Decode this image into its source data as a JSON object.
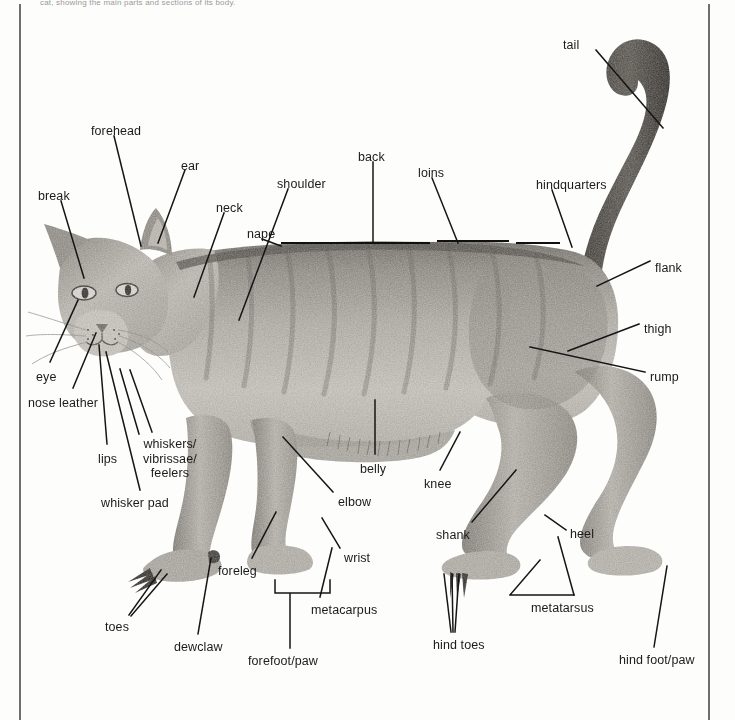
{
  "document": {
    "caption_fragment": "cat, showing the main parts and sections of its body.",
    "figure_title": "Anatomy of the cat — external parts",
    "subject": "cat",
    "illustration_style": "pencil drawing"
  },
  "colors": {
    "ink": "#151515",
    "page": "#fdfdfc",
    "rule": "#6e6e6e",
    "fur_light": "#c9c6c0",
    "fur_mid": "#9b978f",
    "fur_dark": "#6a665f",
    "fur_darkest": "#3d3a35"
  },
  "labels": [
    {
      "id": "tail",
      "text": "tail",
      "x": 563,
      "y": 38,
      "align": "left"
    },
    {
      "id": "forehead",
      "text": "forehead",
      "x": 91,
      "y": 124,
      "align": "left"
    },
    {
      "id": "ear",
      "text": "ear",
      "x": 181,
      "y": 159,
      "align": "left"
    },
    {
      "id": "back",
      "text": "back",
      "x": 358,
      "y": 150,
      "align": "left"
    },
    {
      "id": "loins",
      "text": "loins",
      "x": 418,
      "y": 166,
      "align": "left"
    },
    {
      "id": "hindquarters",
      "text": "hindquarters",
      "x": 536,
      "y": 178,
      "align": "left"
    },
    {
      "id": "shoulder",
      "text": "shoulder",
      "x": 277,
      "y": 177,
      "align": "left"
    },
    {
      "id": "break",
      "text": "break",
      "x": 38,
      "y": 189,
      "align": "left"
    },
    {
      "id": "neck",
      "text": "neck",
      "x": 216,
      "y": 201,
      "align": "left"
    },
    {
      "id": "nape",
      "text": "nape",
      "x": 247,
      "y": 227,
      "align": "left"
    },
    {
      "id": "flank",
      "text": "flank",
      "x": 655,
      "y": 261,
      "align": "left"
    },
    {
      "id": "thigh",
      "text": "thigh",
      "x": 644,
      "y": 322,
      "align": "left"
    },
    {
      "id": "rump",
      "text": "rump",
      "x": 650,
      "y": 370,
      "align": "left"
    },
    {
      "id": "eye",
      "text": "eye",
      "x": 36,
      "y": 370,
      "align": "left"
    },
    {
      "id": "nose-leather",
      "text": "nose leather",
      "x": 28,
      "y": 396,
      "align": "left"
    },
    {
      "id": "whiskers",
      "text": "whiskers/\nvibrissae/\nfeelers",
      "x": 143,
      "y": 437,
      "align": "left"
    },
    {
      "id": "lips",
      "text": "lips",
      "x": 98,
      "y": 452,
      "align": "left"
    },
    {
      "id": "belly",
      "text": "belly",
      "x": 360,
      "y": 462,
      "align": "left"
    },
    {
      "id": "knee",
      "text": "knee",
      "x": 424,
      "y": 477,
      "align": "left"
    },
    {
      "id": "whisker-pad",
      "text": "whisker pad",
      "x": 101,
      "y": 496,
      "align": "left"
    },
    {
      "id": "elbow",
      "text": "elbow",
      "x": 338,
      "y": 495,
      "align": "left"
    },
    {
      "id": "shank",
      "text": "shank",
      "x": 436,
      "y": 528,
      "align": "left"
    },
    {
      "id": "heel",
      "text": "heel",
      "x": 570,
      "y": 527,
      "align": "left"
    },
    {
      "id": "wrist",
      "text": "wrist",
      "x": 344,
      "y": 551,
      "align": "left"
    },
    {
      "id": "foreleg",
      "text": "foreleg",
      "x": 218,
      "y": 564,
      "align": "left"
    },
    {
      "id": "metatarsus",
      "text": "metatarsus",
      "x": 531,
      "y": 601,
      "align": "left"
    },
    {
      "id": "metacarpus",
      "text": "metacarpus",
      "x": 311,
      "y": 603,
      "align": "left"
    },
    {
      "id": "toes",
      "text": "toes",
      "x": 105,
      "y": 620,
      "align": "left"
    },
    {
      "id": "hind-toes",
      "text": "hind toes",
      "x": 433,
      "y": 638,
      "align": "left"
    },
    {
      "id": "dewclaw",
      "text": "dewclaw",
      "x": 174,
      "y": 640,
      "align": "left"
    },
    {
      "id": "hind-foot-paw",
      "text": "hind foot/paw",
      "x": 619,
      "y": 653,
      "align": "left"
    },
    {
      "id": "forefoot-paw",
      "text": "forefoot/paw",
      "x": 248,
      "y": 654,
      "align": "left"
    }
  ],
  "leaders": [
    {
      "id": "tail",
      "d": "M 596 50 L 663 128"
    },
    {
      "id": "forehead",
      "d": "M 114 136 L 141 246"
    },
    {
      "id": "ear",
      "d": "M 185 170 L 158 243"
    },
    {
      "id": "back",
      "d": "M 373 162 L 373 243"
    },
    {
      "id": "loins",
      "d": "M 432 178 L 458 243"
    },
    {
      "id": "hindquarters",
      "d": "M 552 190 L 572 247"
    },
    {
      "id": "shoulder",
      "d": "M 288 189 L 239 320"
    },
    {
      "id": "break",
      "d": "M 61 201 L 84 278"
    },
    {
      "id": "neck",
      "d": "M 224 213 L 194 297"
    },
    {
      "id": "nape",
      "d": "M 262 239 L 281 246"
    },
    {
      "id": "flank",
      "d": "M 650 261 L 597 286"
    },
    {
      "id": "thigh",
      "d": "M 639 324 L 568 351"
    },
    {
      "id": "rump",
      "d": "M 645 372 L 530 347"
    },
    {
      "id": "eye",
      "d": "M 50 362 L 78 300"
    },
    {
      "id": "nose-leather",
      "d": "M 73 388 L 96 333"
    },
    {
      "id": "whiskers-a",
      "d": "M 139 434 L 120 369"
    },
    {
      "id": "whiskers-b",
      "d": "M 152 432 L 130 370"
    },
    {
      "id": "lips",
      "d": "M 107 444 L 99 345"
    },
    {
      "id": "belly",
      "d": "M 375 454 L 375 400"
    },
    {
      "id": "knee",
      "d": "M 440 470 L 460 432"
    },
    {
      "id": "whisker-pad",
      "d": "M 140 490 L 106 352"
    },
    {
      "id": "elbow",
      "d": "M 333 492 L 283 437"
    },
    {
      "id": "shank",
      "d": "M 472 522 L 516 470"
    },
    {
      "id": "heel",
      "d": "M 566 530 L 545 515"
    },
    {
      "id": "wrist",
      "d": "M 340 548 L 322 518"
    },
    {
      "id": "foreleg",
      "d": "M 252 558 L 276 512"
    },
    {
      "id": "metatarsus",
      "d": "M 574 595 L 558 537"
    },
    {
      "id": "metacarpus",
      "d": "M 320 597 L 332 548"
    },
    {
      "id": "toes-a",
      "d": "M 129 615 L 161 570"
    },
    {
      "id": "toes-b",
      "d": "M 131 616 L 167 574"
    },
    {
      "id": "hind-toes-a",
      "d": "M 451 632 L 444 574"
    },
    {
      "id": "hind-toes-b",
      "d": "M 453 632 L 452 574"
    },
    {
      "id": "hind-toes-c",
      "d": "M 455 632 L 459 574"
    },
    {
      "id": "dewclaw",
      "d": "M 198 634 L 211 558"
    },
    {
      "id": "hind-foot",
      "d": "M 654 647 L 667 566"
    },
    {
      "id": "forefoot-brkt",
      "d": "M 275 580 L 275 593 L 330 593 L 330 580 M 290 593 L 290 648"
    },
    {
      "id": "metatarsus-brkt",
      "d": "M 574 595 L 510 595 M 510 595 L 540 560"
    }
  ],
  "spine_ticks": {
    "description": "horizontal rule segments along the cat's back marking back / loins sections",
    "segments": [
      {
        "x1": 281,
        "x2": 430,
        "y": 243
      },
      {
        "x1": 437,
        "x2": 509,
        "y": 241
      },
      {
        "x1": 516,
        "x2": 560,
        "y": 243
      }
    ]
  }
}
